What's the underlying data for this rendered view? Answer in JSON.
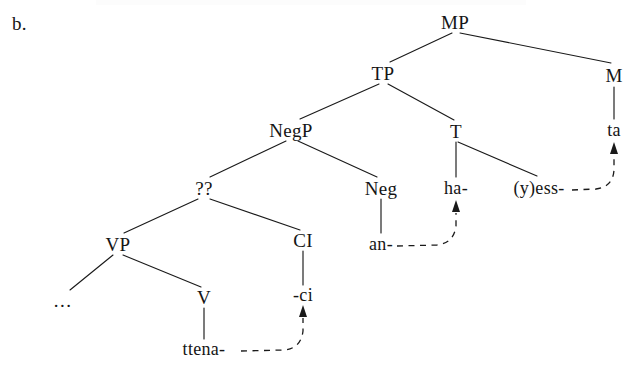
{
  "figure": {
    "item_label": "b.",
    "nodes": [
      {
        "id": "MP",
        "label": "MP",
        "x": 455,
        "y": 22,
        "kind": "category"
      },
      {
        "id": "TP",
        "label": "TP",
        "x": 383,
        "y": 73,
        "kind": "category"
      },
      {
        "id": "M",
        "label": "M",
        "x": 614,
        "y": 75,
        "kind": "category"
      },
      {
        "id": "ta",
        "label": "ta",
        "x": 614,
        "y": 130,
        "kind": "terminal"
      },
      {
        "id": "NegP",
        "label": "NegP",
        "x": 291,
        "y": 130,
        "kind": "category"
      },
      {
        "id": "T",
        "label": "T",
        "x": 456,
        "y": 131,
        "kind": "category"
      },
      {
        "id": "QQ",
        "label": "??",
        "x": 204,
        "y": 188,
        "kind": "category"
      },
      {
        "id": "Neg",
        "label": "Neg",
        "x": 381,
        "y": 188,
        "kind": "category"
      },
      {
        "id": "ha",
        "label": "ha-",
        "x": 456,
        "y": 188,
        "kind": "terminal"
      },
      {
        "id": "yess",
        "label": "(y)ess-",
        "x": 539,
        "y": 188,
        "kind": "terminal"
      },
      {
        "id": "an",
        "label": "an-",
        "x": 381,
        "y": 244,
        "kind": "terminal"
      },
      {
        "id": "VP",
        "label": "VP",
        "x": 118,
        "y": 244,
        "kind": "category"
      },
      {
        "id": "CI",
        "label": "CI",
        "x": 303,
        "y": 240,
        "kind": "category"
      },
      {
        "id": "dots",
        "label": "...",
        "x": 63,
        "y": 300,
        "kind": "terminal"
      },
      {
        "id": "V",
        "label": "V",
        "x": 204,
        "y": 297,
        "kind": "category"
      },
      {
        "id": "ci",
        "label": "-ci",
        "x": 303,
        "y": 295,
        "kind": "terminal"
      },
      {
        "id": "ttena",
        "label": "ttena-",
        "x": 204,
        "y": 349,
        "kind": "terminal"
      }
    ],
    "branches": [
      {
        "from": "MP",
        "to": "TP",
        "type": "branch"
      },
      {
        "from": "MP",
        "to": "M",
        "type": "branch"
      },
      {
        "from": "M",
        "to": "ta",
        "type": "stem"
      },
      {
        "from": "TP",
        "to": "NegP",
        "type": "branch"
      },
      {
        "from": "TP",
        "to": "T",
        "type": "branch"
      },
      {
        "from": "NegP",
        "to": "QQ",
        "type": "branch"
      },
      {
        "from": "NegP",
        "to": "Neg",
        "type": "branch"
      },
      {
        "from": "T",
        "to": "ha",
        "type": "stem"
      },
      {
        "from": "T",
        "to": "yess",
        "type": "branch"
      },
      {
        "from": "Neg",
        "to": "an",
        "type": "stem"
      },
      {
        "from": "QQ",
        "to": "VP",
        "type": "branch"
      },
      {
        "from": "QQ",
        "to": "CI",
        "type": "branch"
      },
      {
        "from": "VP",
        "to": "dots",
        "type": "branch"
      },
      {
        "from": "VP",
        "to": "V",
        "type": "branch"
      },
      {
        "from": "CI",
        "to": "ci",
        "type": "stem"
      },
      {
        "from": "V",
        "to": "ttena",
        "type": "stem"
      }
    ],
    "movements": [
      {
        "from": "ttena",
        "to": "ci",
        "style": "dashed-arrow"
      },
      {
        "from": "an",
        "to": "ha",
        "style": "dashed-arrow"
      },
      {
        "from": "yess",
        "to": "ta",
        "style": "dashed-arrow"
      }
    ]
  }
}
